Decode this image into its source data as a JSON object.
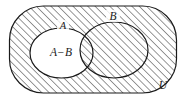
{
  "figure": {
    "kind": "venn-diagram",
    "caption_concept": "A-B",
    "background_color": "#ffffff",
    "stroke_color": "#1a1a1a",
    "hatch_color": "#3a3a3a"
  },
  "universe": {
    "label": "U",
    "shape": "rounded-rectangle",
    "label_x": 163,
    "label_y": 86,
    "font_size": 11
  },
  "sets": [
    {
      "id": "A",
      "label": "A",
      "shape": "ellipse",
      "label_x": 63,
      "label_y": 28,
      "font_size": 10
    },
    {
      "id": "B",
      "label": "B",
      "shape": "ellipse",
      "label_x": 113,
      "label_y": 19,
      "font_size": 11
    }
  ],
  "regions": [
    {
      "id": "A-minus-B",
      "label": "A−B",
      "fill": "white",
      "label_x": 61,
      "label_y": 55,
      "font_size": 11
    },
    {
      "id": "shaded-remainder",
      "label": "",
      "fill": "hatched"
    }
  ]
}
